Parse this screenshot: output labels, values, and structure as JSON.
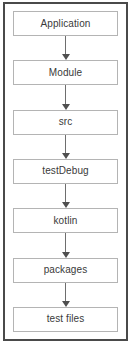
{
  "diagram": {
    "type": "vertical-flowchart",
    "orientation": "top-to-bottom",
    "frame_color": "#4a4a4a",
    "node_border_color": "#b4b4b4",
    "node_fill_color": "#ffffff",
    "connector_color": "#6e6e6e",
    "text_color": "#3a3a3a",
    "nodes": [
      {
        "id": "application",
        "label": "Application"
      },
      {
        "id": "module",
        "label": "Module"
      },
      {
        "id": "src",
        "label": "src"
      },
      {
        "id": "testdebug",
        "label": "testDebug"
      },
      {
        "id": "kotlin",
        "label": "kotlin"
      },
      {
        "id": "packages",
        "label": "packages"
      },
      {
        "id": "test-files",
        "label": "test files"
      }
    ],
    "connectors": [
      {
        "from": "application",
        "to": "module",
        "arrow": "down-arrow-icon"
      },
      {
        "from": "module",
        "to": "src",
        "arrow": "down-arrow-icon"
      },
      {
        "from": "src",
        "to": "testdebug",
        "arrow": "down-arrow-icon"
      },
      {
        "from": "testdebug",
        "to": "kotlin",
        "arrow": "down-arrow-icon"
      },
      {
        "from": "kotlin",
        "to": "packages",
        "arrow": "down-arrow-icon"
      },
      {
        "from": "packages",
        "to": "test-files",
        "arrow": "down-arrow-icon"
      }
    ]
  }
}
